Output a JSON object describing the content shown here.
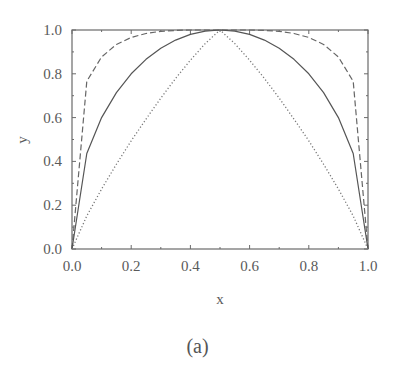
{
  "chart_data": {
    "type": "line",
    "title": "",
    "caption": "(a)",
    "xlabel": "x",
    "ylabel": "y",
    "xlim": [
      0,
      1
    ],
    "ylim": [
      0,
      1
    ],
    "grid": false,
    "legend": null,
    "xticks": [
      "0.0",
      "0.2",
      "0.4",
      "0.6",
      "0.8",
      "1.0"
    ],
    "yticks": [
      "0.0",
      "0.2",
      "0.4",
      "0.6",
      "0.8",
      "1.0"
    ],
    "x": [
      0,
      0.05,
      0.1,
      0.15,
      0.2,
      0.25,
      0.3,
      0.35,
      0.4,
      0.45,
      0.5,
      0.55,
      0.6,
      0.65,
      0.7,
      0.75,
      0.8,
      0.85,
      0.9,
      0.95,
      1.0
    ],
    "series": [
      {
        "name": "dashed",
        "style": "dashed",
        "color": "#666666",
        "values": [
          0,
          0.766,
          0.877,
          0.934,
          0.966,
          0.984,
          0.994,
          0.998,
          1.0,
          1.0,
          1.0,
          1.0,
          1.0,
          0.998,
          0.994,
          0.984,
          0.966,
          0.934,
          0.877,
          0.766,
          0
        ]
      },
      {
        "name": "solid",
        "style": "solid",
        "color": "#555555",
        "values": [
          0,
          0.436,
          0.6,
          0.714,
          0.8,
          0.866,
          0.917,
          0.954,
          0.98,
          0.995,
          1.0,
          0.995,
          0.98,
          0.954,
          0.917,
          0.866,
          0.8,
          0.714,
          0.6,
          0.436,
          0
        ]
      },
      {
        "name": "dotted",
        "style": "dotted",
        "color": "#777777",
        "values": [
          0,
          0.151,
          0.274,
          0.387,
          0.494,
          0.593,
          0.689,
          0.779,
          0.862,
          0.938,
          1.0,
          0.938,
          0.862,
          0.779,
          0.689,
          0.593,
          0.494,
          0.387,
          0.274,
          0.151,
          0
        ]
      }
    ]
  }
}
